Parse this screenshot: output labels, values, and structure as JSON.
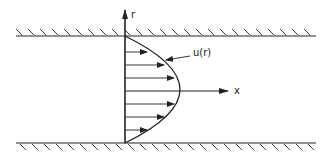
{
  "diagram": {
    "labels": {
      "r_axis": "r",
      "x_axis": "x",
      "profile": "u(r)"
    },
    "colors": {
      "ink": "#222222",
      "background": "#ffffff"
    },
    "geometry": {
      "top_wall_y": 36,
      "bottom_wall_y": 143,
      "axis_x": 125,
      "centerline_y": 91,
      "arrow_rows": 7
    }
  }
}
